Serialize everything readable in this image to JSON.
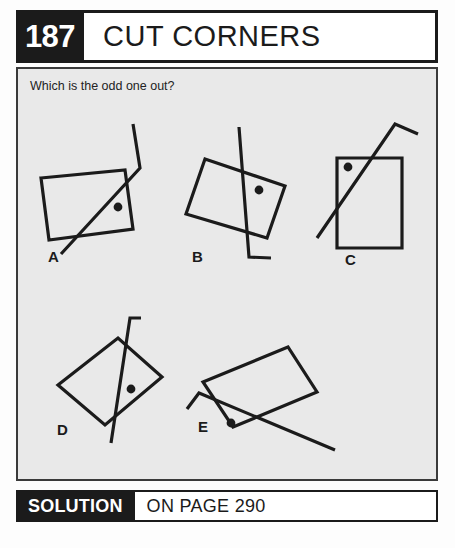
{
  "header": {
    "number": "187",
    "title": "CUT CORNERS"
  },
  "question": "Which is the odd one out?",
  "solution": {
    "label": "SOLUTION",
    "page_text": "ON PAGE 290"
  },
  "colors": {
    "ink": "#1b1b1b",
    "panel_bg": "#e9e9e9",
    "page_bg": "#fdfdfd",
    "border": "#3a3a3a"
  },
  "figure": {
    "type": "odd-one-out-puzzle",
    "items": [
      {
        "label": "A",
        "label_pos": [
          48,
          262
        ],
        "rect": [
          [
            41,
            178
          ],
          [
            125,
            170
          ],
          [
            133,
            229
          ],
          [
            49,
            240
          ]
        ],
        "line": [
          [
            61,
            254
          ],
          [
            140,
            168
          ],
          [
            133,
            124
          ]
        ],
        "dot": [
          118,
          207
        ]
      },
      {
        "label": "B",
        "label_pos": [
          192,
          262
        ],
        "rect": [
          [
            205,
            159
          ],
          [
            285,
            186
          ],
          [
            267,
            238
          ],
          [
            186,
            214
          ]
        ],
        "line": [
          [
            239,
            127
          ],
          [
            249,
            257
          ],
          [
            249,
            257
          ],
          [
            271,
            258
          ]
        ],
        "dot": [
          259,
          190
        ]
      },
      {
        "label": "C",
        "label_pos": [
          345,
          265
        ],
        "rect": [
          [
            337,
            158
          ],
          [
            402,
            158
          ],
          [
            402,
            248
          ],
          [
            337,
            248
          ]
        ],
        "line": [
          [
            317,
            238
          ],
          [
            395,
            124
          ],
          [
            418,
            134
          ]
        ],
        "dot": [
          348,
          167
        ]
      },
      {
        "label": "D",
        "label_pos": [
          57,
          435
        ],
        "rect": [
          [
            58,
            385
          ],
          [
            118,
            338
          ],
          [
            162,
            377
          ],
          [
            105,
            425
          ]
        ],
        "line": [
          [
            111,
            443
          ],
          [
            130,
            318
          ],
          [
            141,
            318
          ]
        ],
        "dot": [
          131,
          389
        ]
      },
      {
        "label": "E",
        "label_pos": [
          198,
          432
        ],
        "rect": [
          [
            203,
            382
          ],
          [
            288,
            347
          ],
          [
            317,
            392
          ],
          [
            233,
            427
          ]
        ],
        "line": [
          [
            187,
            409
          ],
          [
            199,
            393
          ],
          [
            335,
            450
          ]
        ],
        "dot": [
          231,
          423
        ]
      }
    ]
  }
}
